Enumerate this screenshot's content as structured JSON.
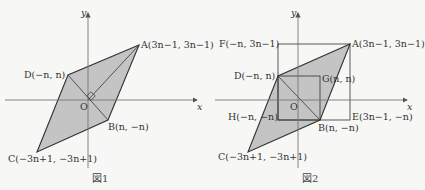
{
  "figure1": {
    "caption": "図1",
    "axis_x": "x",
    "axis_y": "y",
    "origin": "O",
    "points": {
      "A": "A(3n−1,  3n−1)",
      "B": "B(n,  −n)",
      "C": "C(−3n+1,  −3n+1)",
      "D": "D(−n,  n)"
    }
  },
  "figure2": {
    "caption": "図2",
    "axis_x": "x",
    "axis_y": "y",
    "origin": "O",
    "points": {
      "A": "A(3n−1,  3n−1)",
      "B": "B(n,  −n)",
      "C": "C(−3n+1,  −3n+1)",
      "D": "D(−n,  n)",
      "E": "E(3n−1,  −n)",
      "F": "F(−n,  3n−1)",
      "G": "G(n,  n)",
      "H": "H(−n,  −n)"
    }
  },
  "colors": {
    "fill": "#c4c4c4",
    "stroke": "#333333",
    "axis": "#777777",
    "background": "#f7f7f5"
  }
}
